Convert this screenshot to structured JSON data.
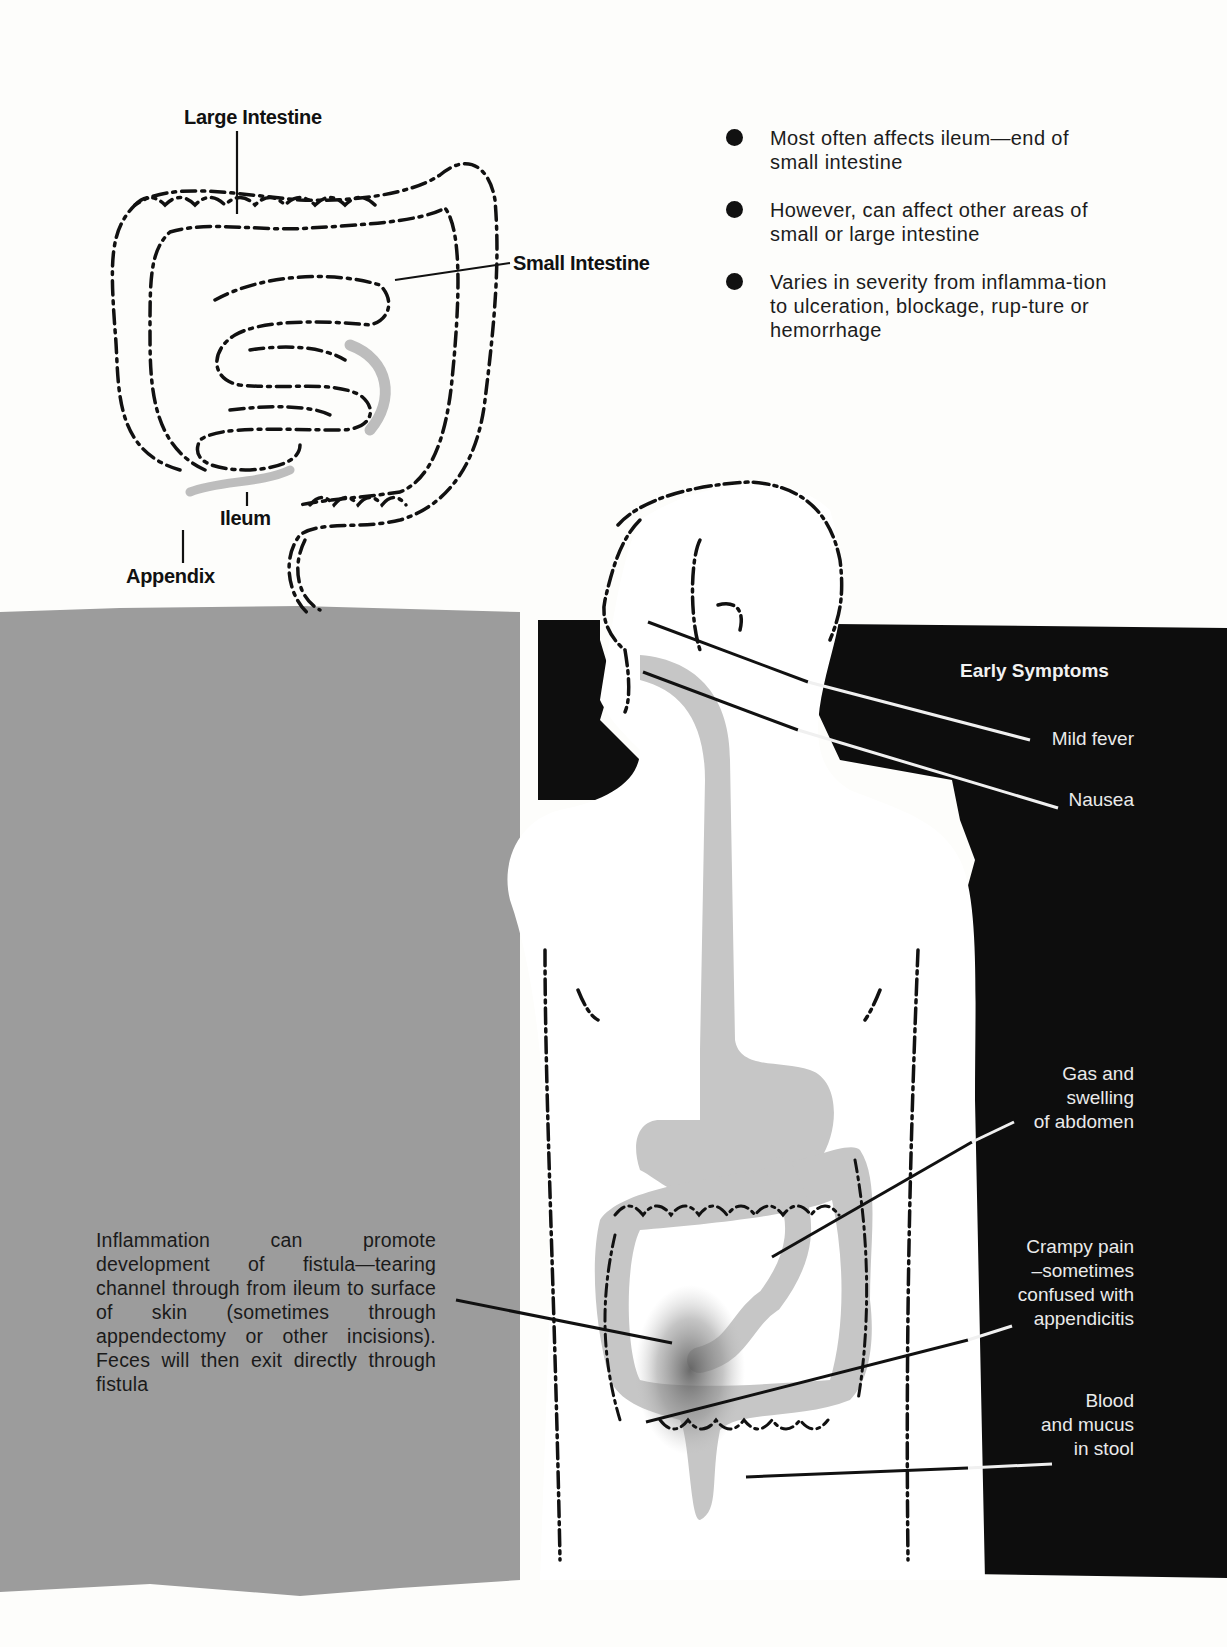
{
  "colon_diagram": {
    "labels": {
      "large_intestine": "Large Intestine",
      "small_intestine": "Small Intestine",
      "ileum": "Ileum",
      "appendix": "Appendix"
    }
  },
  "facts": {
    "items": [
      {
        "text": "Most often affects ileum—end of small intestine"
      },
      {
        "text": "However, can affect other areas of small or large intestine"
      },
      {
        "text": "Varies in severity from inflamma-tion to ulceration, blockage, rup-ture or hemorrhage"
      }
    ]
  },
  "symptoms": {
    "title": "Early Symptoms",
    "items": [
      {
        "label": "Mild fever"
      },
      {
        "label": "Nausea"
      },
      {
        "label": "Gas and\nswelling\nof abdomen"
      },
      {
        "label": "Crampy pain\n–sometimes\nconfused with\nappendicitis"
      },
      {
        "label": "Blood\nand mucus\nin stool"
      }
    ]
  },
  "fistula_note": {
    "text": "Inflammation can promote development of fistula—tearing channel through from ileum to surface of skin (sometimes through appendectomy or other incisions). Feces will then exit directly through fistula"
  },
  "colors": {
    "page_bg": "#fdfdfb",
    "gray_panel": "#9a9a9a",
    "black_panel": "#0d0d0d",
    "organ_gray": "#c4c4c4",
    "ink": "#111111"
  }
}
